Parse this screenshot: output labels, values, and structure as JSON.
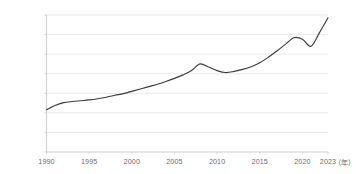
{
  "chart_data": {
    "type": "line",
    "title": "",
    "subtitle": "",
    "xlabel": "（年）",
    "ylabel": "",
    "grid": true,
    "legend": false,
    "legend_position": "none",
    "line_color": "#3b3b3b",
    "grid_color": "#e3e3e3",
    "axis_color": "#c9c9c9",
    "tick_label_color": "#6b6b6b",
    "xlim": [
      1990,
      2023
    ],
    "ylim": [
      0,
      3500000
    ],
    "x_ticks": [
      1990,
      1995,
      2000,
      2005,
      2010,
      2015,
      2020,
      2023
    ],
    "x_tick_labels": [
      "1990",
      "1995",
      "2000",
      "2005",
      "2010",
      "2015",
      "2020",
      "2023"
    ],
    "y_ticks": [
      0,
      500000,
      1000000,
      1500000,
      2000000,
      2500000,
      3000000,
      3500000
    ],
    "y_tick_labels": [
      "0",
      "500000",
      "1000000",
      "1500000",
      "2000000",
      "2500000",
      "3000000",
      "3500000"
    ],
    "x": [
      1990,
      1991,
      1992,
      1993,
      1994,
      1995,
      1996,
      1997,
      1998,
      1999,
      2000,
      2001,
      2002,
      2003,
      2004,
      2005,
      2006,
      2007,
      2008,
      2009,
      2010,
      2011,
      2012,
      2013,
      2014,
      2015,
      2016,
      2017,
      2018,
      2019,
      2020,
      2021,
      2022,
      2023
    ],
    "values": [
      1080000,
      1190000,
      1260000,
      1290000,
      1310000,
      1330000,
      1360000,
      1400000,
      1450000,
      1490000,
      1550000,
      1610000,
      1670000,
      1730000,
      1800000,
      1880000,
      1970000,
      2080000,
      2250000,
      2170000,
      2080000,
      2030000,
      2060000,
      2110000,
      2180000,
      2280000,
      2420000,
      2580000,
      2750000,
      2920000,
      2880000,
      2700000,
      3050000,
      3430000
    ],
    "series_name": "",
    "annotations": []
  }
}
